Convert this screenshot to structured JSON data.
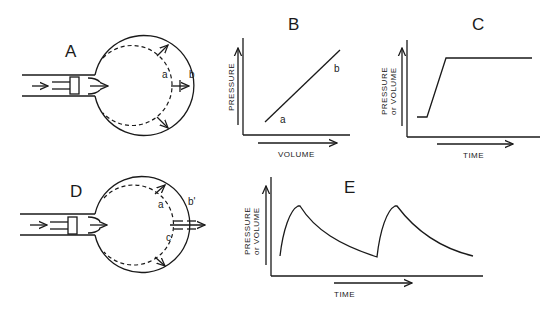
{
  "figure": {
    "panels": {
      "A": {
        "label": "A",
        "point_a": "a",
        "point_b": "b"
      },
      "B": {
        "label": "B",
        "xlabel": "VOLUME",
        "ylabel": "PRESSURE",
        "point_a": "a",
        "point_b": "b"
      },
      "C": {
        "label": "C",
        "xlabel": "TIME",
        "ylabel_line1": "PRESSURE",
        "ylabel_line2": "or VOLUME"
      },
      "D": {
        "label": "D",
        "point_a": "a",
        "point_b": "b'",
        "point_c": "c"
      },
      "E": {
        "label": "E",
        "xlabel": "TIME",
        "ylabel_line1": "PRESSURE",
        "ylabel_line2": "or VOLUME"
      }
    }
  },
  "colors": {
    "ink": "#1a1a1a",
    "background": "#ffffff"
  }
}
